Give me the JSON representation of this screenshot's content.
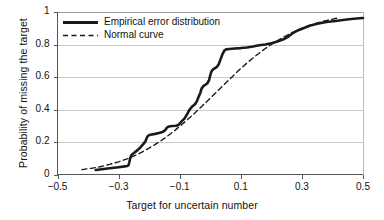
{
  "chart_data": {
    "type": "line",
    "title": "",
    "xlabel": "Target for uncertain number",
    "ylabel": "Probability of missing the target",
    "xlim": [
      -0.5,
      0.5
    ],
    "ylim": [
      0,
      1
    ],
    "xticks": [
      "-0.5",
      "-0.3",
      "-0.1",
      "0.1",
      "0.3",
      "0.5"
    ],
    "xtick_values": [
      -0.5,
      -0.3,
      -0.1,
      0.1,
      0.3,
      0.5
    ],
    "yticks": [
      "0",
      "0.2",
      "0.4",
      "0.6",
      "0.8",
      "1"
    ],
    "ytick_values": [
      0,
      0.2,
      0.4,
      0.6,
      0.8,
      1
    ],
    "grid": "horizontal",
    "legend_position": "top-left",
    "series": [
      {
        "name": "Empirical error distribution",
        "style": "solid",
        "color": "#1a1a1a",
        "points": [
          [
            -0.375,
            0.028
          ],
          [
            -0.355,
            0.032
          ],
          [
            -0.33,
            0.038
          ],
          [
            -0.3,
            0.045
          ],
          [
            -0.28,
            0.05
          ],
          [
            -0.272,
            0.052
          ],
          [
            -0.268,
            0.056
          ],
          [
            -0.265,
            0.075
          ],
          [
            -0.262,
            0.1
          ],
          [
            -0.258,
            0.12
          ],
          [
            -0.25,
            0.132
          ],
          [
            -0.238,
            0.15
          ],
          [
            -0.228,
            0.168
          ],
          [
            -0.218,
            0.19
          ],
          [
            -0.212,
            0.205
          ],
          [
            -0.208,
            0.225
          ],
          [
            -0.204,
            0.238
          ],
          [
            -0.196,
            0.245
          ],
          [
            -0.18,
            0.25
          ],
          [
            -0.168,
            0.255
          ],
          [
            -0.156,
            0.262
          ],
          [
            -0.148,
            0.272
          ],
          [
            -0.142,
            0.288
          ],
          [
            -0.136,
            0.295
          ],
          [
            -0.124,
            0.298
          ],
          [
            -0.112,
            0.3
          ],
          [
            -0.104,
            0.305
          ],
          [
            -0.098,
            0.318
          ],
          [
            -0.092,
            0.33
          ],
          [
            -0.084,
            0.345
          ],
          [
            -0.076,
            0.37
          ],
          [
            -0.07,
            0.392
          ],
          [
            -0.064,
            0.408
          ],
          [
            -0.058,
            0.42
          ],
          [
            -0.05,
            0.432
          ],
          [
            -0.044,
            0.45
          ],
          [
            -0.038,
            0.478
          ],
          [
            -0.032,
            0.505
          ],
          [
            -0.028,
            0.53
          ],
          [
            -0.022,
            0.545
          ],
          [
            -0.016,
            0.552
          ],
          [
            -0.01,
            0.56
          ],
          [
            -0.004,
            0.58
          ],
          [
            0.0,
            0.61
          ],
          [
            0.004,
            0.635
          ],
          [
            0.01,
            0.648
          ],
          [
            0.016,
            0.655
          ],
          [
            0.022,
            0.662
          ],
          [
            0.028,
            0.68
          ],
          [
            0.034,
            0.71
          ],
          [
            0.04,
            0.74
          ],
          [
            0.046,
            0.762
          ],
          [
            0.052,
            0.77
          ],
          [
            0.062,
            0.772
          ],
          [
            0.08,
            0.775
          ],
          [
            0.1,
            0.778
          ],
          [
            0.12,
            0.782
          ],
          [
            0.14,
            0.788
          ],
          [
            0.16,
            0.795
          ],
          [
            0.18,
            0.8
          ],
          [
            0.2,
            0.808
          ],
          [
            0.22,
            0.818
          ],
          [
            0.24,
            0.832
          ],
          [
            0.258,
            0.852
          ],
          [
            0.272,
            0.872
          ],
          [
            0.288,
            0.888
          ],
          [
            0.305,
            0.9
          ],
          [
            0.325,
            0.915
          ],
          [
            0.35,
            0.928
          ],
          [
            0.38,
            0.938
          ],
          [
            0.41,
            0.945
          ],
          [
            0.44,
            0.952
          ],
          [
            0.47,
            0.958
          ],
          [
            0.5,
            0.963
          ]
        ]
      },
      {
        "name": "Normal curve",
        "style": "dashed",
        "color": "#1a1a1a",
        "points": [
          [
            -0.42,
            0.03
          ],
          [
            -0.39,
            0.038
          ],
          [
            -0.36,
            0.048
          ],
          [
            -0.33,
            0.062
          ],
          [
            -0.3,
            0.078
          ],
          [
            -0.27,
            0.098
          ],
          [
            -0.24,
            0.122
          ],
          [
            -0.21,
            0.152
          ],
          [
            -0.18,
            0.185
          ],
          [
            -0.15,
            0.222
          ],
          [
            -0.12,
            0.265
          ],
          [
            -0.09,
            0.312
          ],
          [
            -0.06,
            0.362
          ],
          [
            -0.03,
            0.415
          ],
          [
            0.0,
            0.47
          ],
          [
            0.03,
            0.525
          ],
          [
            0.06,
            0.58
          ],
          [
            0.09,
            0.635
          ],
          [
            0.12,
            0.686
          ],
          [
            0.15,
            0.732
          ],
          [
            0.18,
            0.775
          ],
          [
            0.21,
            0.812
          ],
          [
            0.24,
            0.845
          ],
          [
            0.27,
            0.875
          ],
          [
            0.3,
            0.9
          ],
          [
            0.33,
            0.92
          ],
          [
            0.36,
            0.938
          ],
          [
            0.39,
            0.952
          ],
          [
            0.415,
            0.962
          ]
        ]
      }
    ]
  },
  "legend": {
    "items": [
      {
        "label": "Empirical error distribution",
        "style": "solid"
      },
      {
        "label": "Normal curve",
        "style": "dashed"
      }
    ]
  }
}
